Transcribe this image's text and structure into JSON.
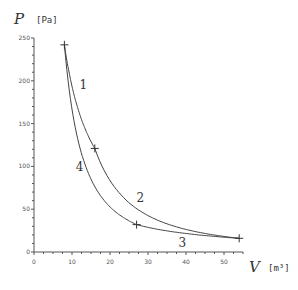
{
  "chart_data": {
    "type": "line",
    "title": "",
    "xlabel": "V",
    "xunit": "[m³]",
    "ylabel": "P",
    "yunit": "[Pa]",
    "xlim": [
      0,
      55
    ],
    "ylim": [
      0,
      250
    ],
    "xticks": [
      0,
      10,
      20,
      30,
      40,
      50
    ],
    "yticks": [
      0,
      50,
      100,
      150,
      200,
      250
    ],
    "grid": false,
    "legend": "none",
    "points": [
      {
        "V": 8,
        "P": 242
      },
      {
        "V": 16,
        "P": 121
      },
      {
        "V": 54,
        "P": 16
      },
      {
        "V": 27,
        "P": 32
      }
    ],
    "series": [
      {
        "name": "1",
        "kind": "isotherm",
        "from": [
          8,
          242
        ],
        "to": [
          16,
          121
        ],
        "pv_const": 1936
      },
      {
        "name": "2",
        "kind": "adiabat",
        "from": [
          16,
          121
        ],
        "to": [
          54,
          16
        ]
      },
      {
        "name": "3",
        "kind": "isotherm",
        "from": [
          27,
          32
        ],
        "to": [
          54,
          16
        ],
        "pv_const": 864
      },
      {
        "name": "4",
        "kind": "adiabat",
        "from": [
          8,
          242
        ],
        "to": [
          27,
          32
        ]
      }
    ],
    "annotations": [
      {
        "text": "1",
        "V": 12,
        "P": 190
      },
      {
        "text": "2",
        "V": 27,
        "P": 58
      },
      {
        "text": "3",
        "V": 38,
        "P": 6
      },
      {
        "text": "4",
        "V": 11,
        "P": 95
      }
    ]
  }
}
